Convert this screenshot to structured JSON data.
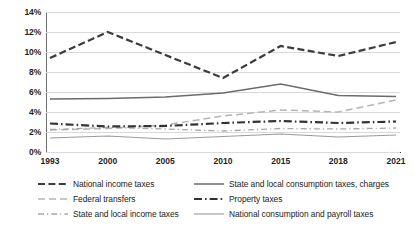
{
  "chart_data": {
    "type": "line",
    "title": "",
    "subtitle": "",
    "xlabel": "",
    "ylabel": "",
    "categories": [
      "1993",
      "2000",
      "2005",
      "2010",
      "2015",
      "2018",
      "2021"
    ],
    "ylim": [
      0,
      14
    ],
    "ytick_labels": [
      "0%",
      "2%",
      "4%",
      "6%",
      "8%",
      "10%",
      "12%",
      "14%"
    ],
    "ytick_values": [
      0,
      2,
      4,
      6,
      8,
      10,
      12,
      14
    ],
    "grid": true,
    "legend_position": "bottom",
    "series": [
      {
        "name": "National income taxes",
        "style": "dashed-heavy",
        "color": "#3c3c3c",
        "values": [
          9.4,
          12.0,
          9.7,
          7.4,
          10.6,
          9.6,
          11.0
        ]
      },
      {
        "name": "State and local consumption taxes, charges",
        "style": "solid-medium",
        "color": "#6b6b6b",
        "values": [
          5.3,
          5.35,
          5.5,
          5.9,
          6.8,
          5.65,
          5.55
        ]
      },
      {
        "name": "Federal transfers",
        "style": "dashed-light",
        "color": "#b5b5b5",
        "values": [
          2.2,
          2.35,
          2.7,
          3.6,
          4.2,
          4.0,
          5.2
        ]
      },
      {
        "name": "Property taxes",
        "style": "dash-dot-heavy",
        "color": "#333333",
        "values": [
          2.85,
          2.55,
          2.6,
          2.9,
          3.1,
          2.9,
          3.05
        ]
      },
      {
        "name": "State and local income taxes",
        "style": "dash-dot-light",
        "color": "#a8a8a8",
        "values": [
          2.25,
          2.45,
          2.3,
          2.1,
          2.35,
          2.3,
          2.4
        ]
      },
      {
        "name": "National consumption and payroll taxes",
        "style": "solid-light",
        "color": "#9a9a9a",
        "values": [
          1.4,
          1.6,
          1.3,
          1.55,
          1.8,
          1.5,
          1.7
        ]
      }
    ]
  },
  "legend": {
    "items": [
      {
        "label": "National income taxes",
        "series_index": 0
      },
      {
        "label": "State and local consumption taxes, charges",
        "series_index": 1
      },
      {
        "label": "Federal transfers",
        "series_index": 2
      },
      {
        "label": "Property taxes",
        "series_index": 3
      },
      {
        "label": "State and local income taxes",
        "series_index": 4
      },
      {
        "label": "National consumption and payroll taxes",
        "series_index": 5
      }
    ]
  }
}
